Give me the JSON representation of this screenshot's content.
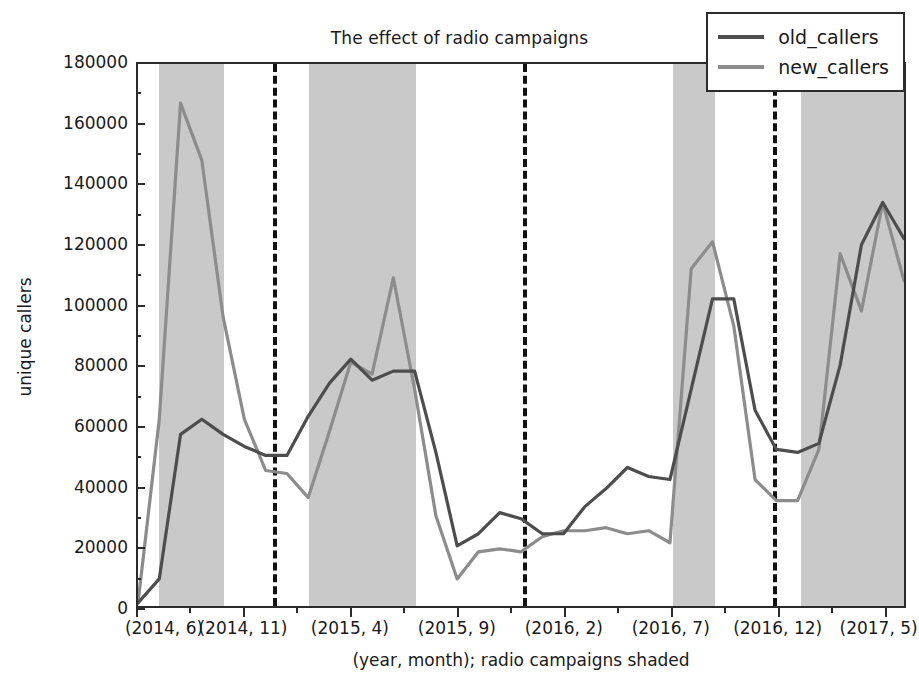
{
  "chart_data": {
    "type": "line",
    "title": "The effect of radio campaigns",
    "xlabel": "(year, month); radio campaigns shaded",
    "ylabel": "unique callers",
    "ylim": [
      0,
      180000
    ],
    "yticks": [
      0,
      20000,
      40000,
      60000,
      80000,
      100000,
      120000,
      140000,
      160000,
      180000
    ],
    "ytick_labels": [
      "0",
      "20000",
      "40000",
      "60000",
      "80000",
      "100000",
      "120000",
      "140000",
      "160000",
      "180000"
    ],
    "grid": false,
    "legend_position": "upper right",
    "x": [
      "(2014, 6)",
      "(2014, 7)",
      "(2014, 8)",
      "(2014, 9)",
      "(2014, 10)",
      "(2014, 11)",
      "(2014, 12)",
      "(2015, 1)",
      "(2015, 2)",
      "(2015, 3)",
      "(2015, 4)",
      "(2015, 5)",
      "(2015, 6)",
      "(2015, 7)",
      "(2015, 8)",
      "(2015, 9)",
      "(2015, 10)",
      "(2015, 11)",
      "(2015, 12)",
      "(2016, 1)",
      "(2016, 2)",
      "(2016, 3)",
      "(2016, 4)",
      "(2016, 5)",
      "(2016, 6)",
      "(2016, 7)",
      "(2016, 8)",
      "(2016, 9)",
      "(2016, 10)",
      "(2016, 11)",
      "(2016, 12)",
      "(2017, 1)",
      "(2017, 2)",
      "(2017, 3)",
      "(2017, 4)",
      "(2017, 5)",
      "(2017, 6)"
    ],
    "xtick_labels": [
      "(2014, 6)",
      "(2014, 11)",
      "(2015, 4)",
      "(2015, 9)",
      "(2016, 2)",
      "(2016, 7)",
      "(2016, 12)",
      "(2017, 5)"
    ],
    "xtick_indices": [
      0,
      5,
      10,
      15,
      20,
      25,
      30,
      35
    ],
    "series": [
      {
        "name": "old_callers",
        "color": "#4d4d4d",
        "values": [
          1000,
          9000,
          57000,
          62000,
          57000,
          53000,
          50000,
          50000,
          63000,
          74000,
          82000,
          75000,
          78000,
          78000,
          51000,
          20000,
          24000,
          31000,
          29000,
          24000,
          24000,
          33000,
          39000,
          46000,
          43000,
          42000,
          72000,
          102000,
          102000,
          65000,
          52000,
          51000,
          54000,
          80000,
          120000,
          134000,
          122000
        ]
      },
      {
        "name": "new_callers",
        "color": "#8c8c8c",
        "values": [
          1000,
          62000,
          167000,
          148000,
          96000,
          62000,
          45000,
          44000,
          36000,
          58000,
          81000,
          77000,
          109000,
          72000,
          30000,
          9000,
          18000,
          19000,
          18000,
          23000,
          25000,
          25000,
          26000,
          24000,
          25000,
          21000,
          112000,
          121000,
          93000,
          42000,
          35000,
          35000,
          52000,
          117000,
          98000,
          134000,
          108000
        ]
      }
    ],
    "shaded_regions": [
      {
        "start_index": 1,
        "end_index": 4,
        "label": "radio campaign"
      },
      {
        "start_index": 8,
        "end_index": 13,
        "label": "radio campaign"
      },
      {
        "start_index": 25,
        "end_index": 27,
        "label": "radio campaign"
      },
      {
        "start_index": 31,
        "end_index": 36,
        "label": "radio campaign"
      }
    ],
    "shade_color": "#c9c9c9",
    "vertical_lines": [
      {
        "index": 6.3,
        "style": "dashed"
      },
      {
        "index": 18.0,
        "style": "dashed"
      },
      {
        "index": 29.7,
        "style": "dashed"
      }
    ],
    "vline_color": "#111111"
  },
  "legend": {
    "items": [
      {
        "label": "old_callers"
      },
      {
        "label": "new_callers"
      }
    ]
  }
}
